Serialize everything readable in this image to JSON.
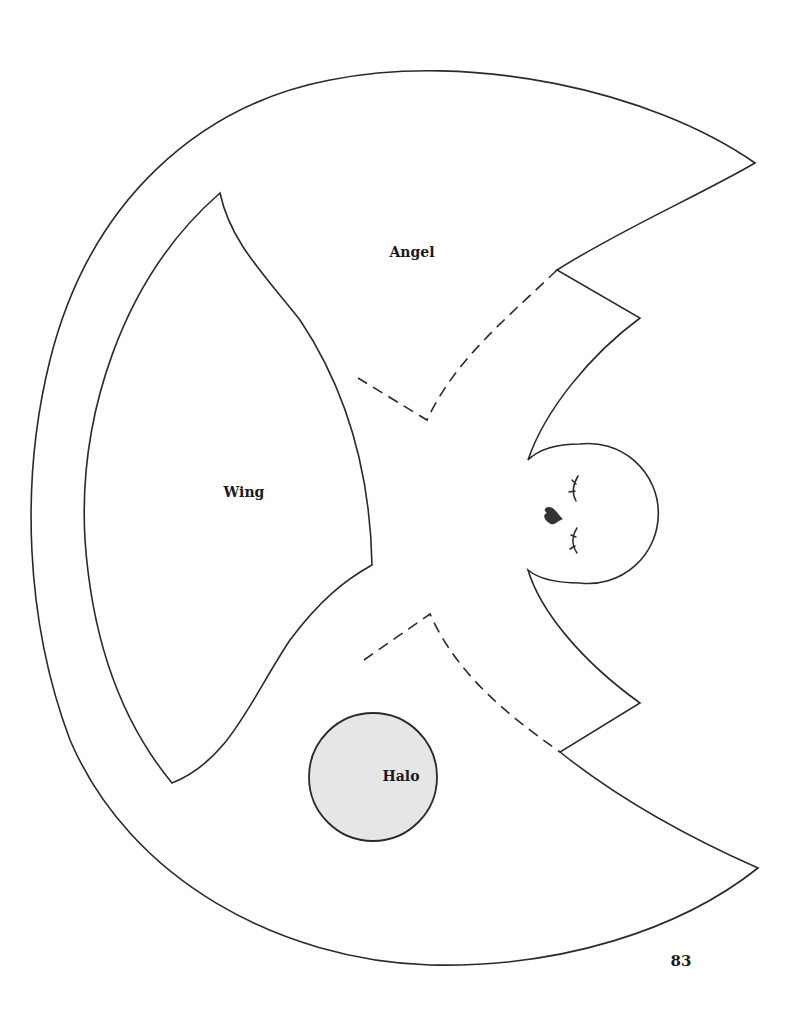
{
  "pattern": {
    "pieces": [
      {
        "name": "Angel",
        "label": "Angel"
      },
      {
        "name": "Wing",
        "label": "Wing"
      },
      {
        "name": "Halo",
        "label": "Halo"
      }
    ],
    "labels": {
      "angel": "Angel",
      "wing": "Wing",
      "halo": "Halo"
    }
  },
  "page": {
    "number": "83"
  },
  "colors": {
    "outline": "#2a2a2a",
    "halo_fill": "#e6e6e6",
    "heart_fill": "#333333",
    "paper": "#ffffff"
  },
  "icons": {
    "nose": "heart-icon",
    "eyes": "closed-eye-lashes-icon"
  }
}
